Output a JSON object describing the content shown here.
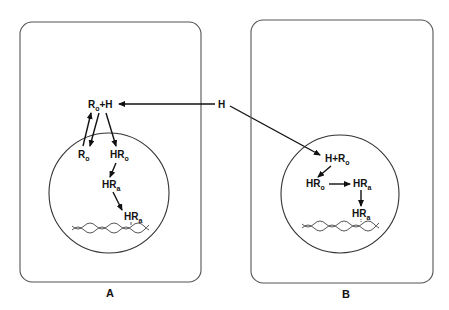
{
  "diagram": {
    "panels": [
      {
        "id": "A",
        "label": "A",
        "cytoplasm_species": [
          {
            "base": "R",
            "sub": "o",
            "plus": "+H"
          }
        ],
        "nuclear_species": [
          {
            "base": "R",
            "sub": "o"
          },
          {
            "base": "HR",
            "sub": "o"
          },
          {
            "base": "HR",
            "sub": "a"
          },
          {
            "base": "HR",
            "sub": "a",
            "note": "bound to DNA"
          }
        ]
      },
      {
        "id": "B",
        "label": "B",
        "cytoplasm_species": [],
        "nuclear_species": [
          {
            "prefix": "H+",
            "base": "R",
            "sub": "o"
          },
          {
            "base": "HR",
            "sub": "o"
          },
          {
            "base": "HR",
            "sub": "a"
          },
          {
            "base": "HR",
            "sub": "a",
            "note": "bound to DNA"
          }
        ]
      }
    ],
    "hormone": {
      "label": "H"
    },
    "text": {
      "a_complex_base": "R",
      "a_complex_sub": "o",
      "a_complex_plus": "+H",
      "a_ro_base": "R",
      "a_ro_sub": "o",
      "a_hro_base": "HR",
      "a_hro_sub": "o",
      "a_hra1_base": "HR",
      "a_hra1_sub": "a",
      "a_hra2_base": "HR",
      "a_hra2_sub": "a",
      "h_free": "H",
      "b_complex_prefix": "H+R",
      "b_complex_sub": "o",
      "b_hro_base": "HR",
      "b_hro_sub": "o",
      "b_hra1_base": "HR",
      "b_hra1_sub": "a",
      "b_hra2_base": "HR",
      "b_hra2_sub": "a",
      "panel_a": "A",
      "panel_b": "B"
    },
    "colors": {
      "line": "#111111",
      "box": "#555555",
      "background": "#ffffff"
    }
  }
}
